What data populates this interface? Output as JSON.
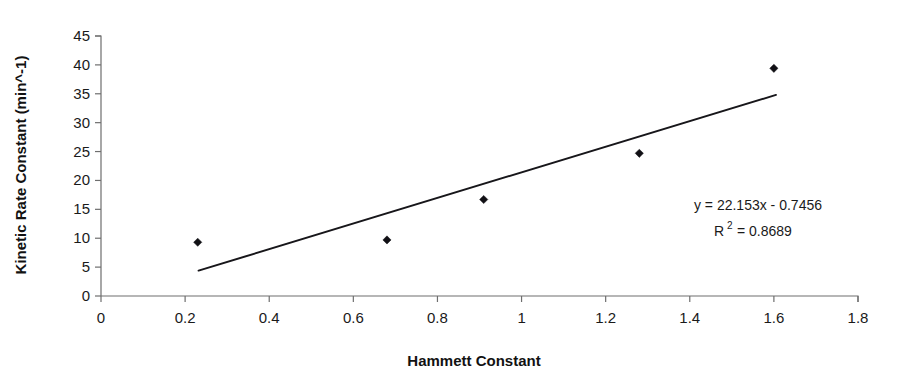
{
  "chart_data": {
    "type": "scatter",
    "title": "",
    "xlabel": "Hammett Constant",
    "ylabel": "Kinetic Rate Constant (min^-1)",
    "xlim": [
      0,
      1.8
    ],
    "ylim": [
      0,
      45
    ],
    "grid": false,
    "legend": false,
    "x_ticks": [
      "0",
      "0.2",
      "0.4",
      "0.6",
      "0.8",
      "1",
      "1.2",
      "1.4",
      "1.6",
      "1.8"
    ],
    "x_tick_values": [
      0,
      0.2,
      0.4,
      0.6,
      0.8,
      1.0,
      1.2,
      1.4,
      1.6,
      1.8
    ],
    "y_ticks": [
      "0",
      "5",
      "10",
      "15",
      "20",
      "25",
      "30",
      "35",
      "40",
      "45"
    ],
    "y_tick_values": [
      0,
      5,
      10,
      15,
      20,
      25,
      30,
      35,
      40,
      45
    ],
    "series": [
      {
        "name": "Kinetic rate vs Hammett constant",
        "marker": "diamond",
        "color": "#111015",
        "points": [
          {
            "x": 0.23,
            "y": 9.3
          },
          {
            "x": 0.68,
            "y": 9.7
          },
          {
            "x": 0.91,
            "y": 16.7
          },
          {
            "x": 1.28,
            "y": 24.7
          },
          {
            "x": 1.6,
            "y": 39.4
          }
        ]
      }
    ],
    "trendline": {
      "type": "linear",
      "slope": 22.153,
      "intercept": -0.7456,
      "r_squared": 0.8689,
      "x_start": 0.232,
      "x_end": 1.605,
      "color": "#17161a"
    },
    "annotations": {
      "equation": "y = 22.153x - 0.7456",
      "r2_prefix": "R",
      "r2_exponent": "2",
      "r2_value": "= 0.8689"
    }
  }
}
